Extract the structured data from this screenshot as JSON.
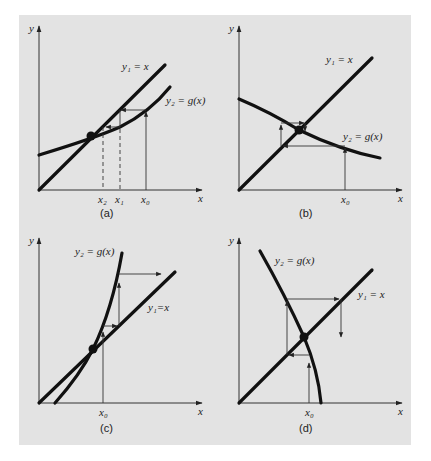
{
  "figure": {
    "background_color": "#e3e3e3",
    "ink_color": "#111111",
    "panels": [
      {
        "id": "a",
        "caption": "(a)",
        "axis_x": "x",
        "axis_y": "y",
        "line_label": "y₁ = x",
        "curve_label": "y₂ = g(x)",
        "tick_labels": [
          "x₂",
          "x₁",
          "x₀"
        ],
        "behavior": "monotone convergence"
      },
      {
        "id": "b",
        "caption": "(b)",
        "axis_x": "x",
        "axis_y": "y",
        "line_label": "y₁ = x",
        "curve_label": "y₂ = g(x)",
        "tick_labels": [
          "x₀"
        ],
        "behavior": "oscillating convergence"
      },
      {
        "id": "c",
        "caption": "(c)",
        "axis_x": "x",
        "axis_y": "y",
        "line_label": "y₁=x",
        "curve_label": "y₂ = g(x)",
        "tick_labels": [
          "x₀"
        ],
        "behavior": "monotone divergence"
      },
      {
        "id": "d",
        "caption": "(d)",
        "axis_x": "x",
        "axis_y": "y",
        "line_label": "y₁ = x",
        "curve_label": "y₂ = g(x)",
        "tick_labels": [
          "x₀"
        ],
        "behavior": "oscillating divergence"
      }
    ]
  }
}
